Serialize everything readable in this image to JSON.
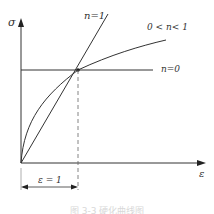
{
  "diagram": {
    "y_axis_label": "σ",
    "x_axis_label": "ε",
    "curves": [
      {
        "label": "n=1",
        "type": "linear"
      },
      {
        "label": "0 < n< 1",
        "type": "concave"
      },
      {
        "label": "n=0",
        "type": "constant"
      }
    ],
    "dimension_label": "ε = 1",
    "caption": "图 3-3 硬化曲线图"
  },
  "colors": {
    "line": "#333333",
    "caption": "#d8d8d8"
  }
}
